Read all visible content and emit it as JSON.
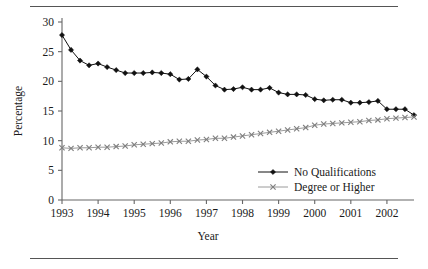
{
  "figure": {
    "top_rule": "horizontal-rule",
    "bottom_rule": "horizontal-rule"
  },
  "chart_data": {
    "type": "line",
    "title": "",
    "xlabel": "Year",
    "ylabel": "Percentage",
    "xlim": [
      1993,
      2002.75
    ],
    "ylim": [
      0,
      30
    ],
    "yticks": [
      0,
      5,
      10,
      15,
      20,
      25,
      30
    ],
    "ytick_labels": [
      "0",
      "5",
      "10",
      "15",
      "20",
      "25",
      "30"
    ],
    "xticks": [
      1993,
      1994,
      1995,
      1996,
      1997,
      1998,
      1999,
      2000,
      2001,
      2002
    ],
    "xtick_labels": [
      "1993",
      "1994",
      "1995",
      "1996",
      "1997",
      "1998",
      "1999",
      "2000",
      "2001",
      "2002"
    ],
    "grid": false,
    "legend_position": "lower-right",
    "x": [
      1993.0,
      1993.25,
      1993.5,
      1993.75,
      1994.0,
      1994.25,
      1994.5,
      1994.75,
      1995.0,
      1995.25,
      1995.5,
      1995.75,
      1996.0,
      1996.25,
      1996.5,
      1996.75,
      1997.0,
      1997.25,
      1997.5,
      1997.75,
      1998.0,
      1998.25,
      1998.5,
      1998.75,
      1999.0,
      1999.25,
      1999.5,
      1999.75,
      2000.0,
      2000.25,
      2000.5,
      2000.75,
      2001.0,
      2001.25,
      2001.5,
      2001.75,
      2002.0,
      2002.25,
      2002.5,
      2002.75
    ],
    "series": [
      {
        "name": "No Qualifications",
        "marker": "filled-diamond",
        "color": "#111111",
        "values": [
          27.8,
          25.3,
          23.5,
          22.7,
          23.0,
          22.4,
          21.9,
          21.4,
          21.4,
          21.4,
          21.5,
          21.4,
          21.2,
          20.3,
          20.4,
          22.0,
          20.8,
          19.3,
          18.6,
          18.7,
          19.0,
          18.6,
          18.6,
          18.9,
          18.1,
          17.8,
          17.8,
          17.7,
          17.0,
          16.8,
          16.9,
          16.9,
          16.4,
          16.4,
          16.5,
          16.7,
          15.3,
          15.3,
          15.3,
          14.3
        ]
      },
      {
        "name": "Degree or Higher",
        "marker": "cross",
        "color": "#7e7e7e",
        "values": [
          8.8,
          8.7,
          8.8,
          8.8,
          8.9,
          8.9,
          9.0,
          9.1,
          9.3,
          9.4,
          9.5,
          9.6,
          9.8,
          9.9,
          9.9,
          10.1,
          10.2,
          10.4,
          10.4,
          10.6,
          10.8,
          11.0,
          11.2,
          11.4,
          11.6,
          11.8,
          12.0,
          12.2,
          12.6,
          12.8,
          12.9,
          13.0,
          13.1,
          13.2,
          13.4,
          13.5,
          13.7,
          13.8,
          13.9,
          14.0
        ]
      }
    ],
    "legend": [
      {
        "label": "No Qualifications",
        "marker": "filled-diamond",
        "color": "#111111"
      },
      {
        "label": "Degree or Higher",
        "marker": "cross",
        "color": "#7e7e7e"
      }
    ]
  }
}
